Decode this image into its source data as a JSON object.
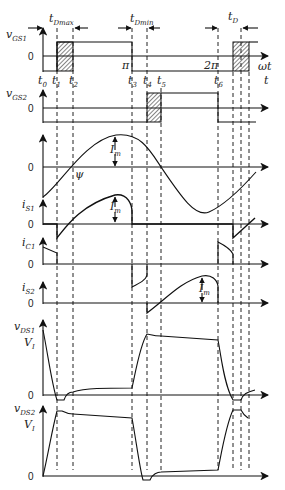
{
  "diagram": {
    "type": "timing-waveforms",
    "time_axis_labels": [
      "ωt",
      "t"
    ],
    "time_markers": [
      "t0",
      "t1",
      "t2",
      "t3",
      "t4",
      "t5",
      "t6"
    ],
    "phase_markers": [
      "π",
      "2π"
    ],
    "dead_time_labels": {
      "max": "tDmax",
      "min": "tDmin",
      "d": "tD"
    },
    "traces": [
      {
        "name": "vGS1",
        "base": "v",
        "subscript": "GS1",
        "zero_label": "0"
      },
      {
        "name": "vGS2",
        "base": "v",
        "subscript": "GS2",
        "zero_label": "0"
      },
      {
        "name": "i",
        "base": "",
        "subscript": "",
        "zero_label": "0",
        "annotations": [
          "Im",
          "ψ"
        ]
      },
      {
        "name": "iS1",
        "base": "i",
        "subscript": "S1",
        "zero_label": "0",
        "annotations": [
          "Im"
        ]
      },
      {
        "name": "iC1",
        "base": "i",
        "subscript": "C1",
        "zero_label": "0"
      },
      {
        "name": "iS2",
        "base": "i",
        "subscript": "S2",
        "zero_label": "0",
        "annotations": [
          "Im"
        ]
      },
      {
        "name": "vDS1",
        "base": "v",
        "subscript": "DS1",
        "zero_label": "0",
        "level_label": "VI"
      },
      {
        "name": "vDS2",
        "base": "v",
        "subscript": "DS2",
        "zero_label": "0",
        "level_label": "VI"
      }
    ],
    "text": {
      "t": "t",
      "zero": "0",
      "pi": "π",
      "two_pi": "2π",
      "omega_t": "ωt",
      "Im": "I",
      "Im_sub": "m",
      "VI": "V",
      "VI_sub": "I",
      "psi": "ψ",
      "tD": "t",
      "tD_sub": "D",
      "tDmax_sub": "Dmax",
      "tDmin_sub": "Dmin",
      "t0_sub": "0",
      "t1_sub": "1",
      "t2_sub": "2",
      "t3_sub": "3",
      "t4_sub": "4",
      "t5_sub": "5",
      "t6_sub": "6",
      "v": "v",
      "i": "i",
      "GS1": "GS1",
      "GS2": "GS2",
      "S1": "S1",
      "C1": "C1",
      "S2": "S2",
      "DS1": "DS1",
      "DS2": "DS2"
    },
    "colors": {
      "line": "#111111",
      "hatch": "#333333",
      "background": "#ffffff"
    }
  }
}
